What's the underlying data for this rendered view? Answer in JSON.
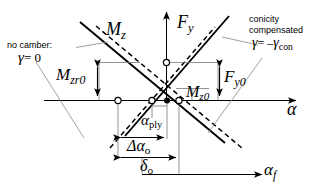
{
  "figure": {
    "type": "engineering-diagram"
  },
  "axes": {
    "vertical_label": "F",
    "vertical_sub": "y",
    "horizontal_label": "α",
    "horizontal_secondary_label": "α",
    "horizontal_secondary_sub": "f"
  },
  "curves": {
    "mz_label": "M",
    "mz_sub": "z"
  },
  "annotations": {
    "no_camber_line1": "no camber:",
    "no_camber_gamma": "γ",
    "no_camber_eq": "= 0",
    "conicity_line1": "conicity",
    "conicity_line2": "compensated",
    "conicity_gamma": "γ",
    "conicity_eq": "= –",
    "conicity_gamma2": "γ",
    "conicity_sub": "con"
  },
  "dimensions": {
    "mzr0": "M",
    "mzr0_sub": "zr0",
    "fy0": "F",
    "fy0_sub": "y0",
    "mz0": "M",
    "mz0_sub": "z0",
    "alpha_ply": "α",
    "alpha_ply_sub": "ply",
    "delta_alpha_o": "Δα",
    "delta_alpha_o_sub": "o",
    "delta_o": "δ",
    "delta_o_sub": "o"
  },
  "colors": {
    "ink": "#000000",
    "leader": "#9a9a9a",
    "thin": "#555555",
    "background": "#ffffff"
  }
}
